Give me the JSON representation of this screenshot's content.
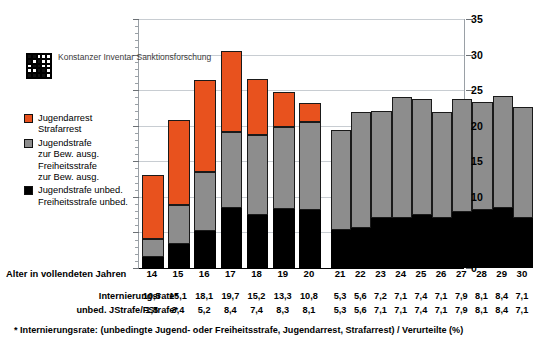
{
  "logo": {
    "name": "konstanzer-inventar-logo",
    "lines": [
      "Konstanzer",
      "Inventar",
      "Sanktionsforschung"
    ]
  },
  "legend": {
    "items": [
      {
        "color": "#e8521e",
        "lines": [
          "Jugendarrest",
          "Strafarrest"
        ]
      },
      {
        "color": "#8d8d8d",
        "lines": [
          "Jugendstrafe",
          "zur Bew. ausg.",
          "Freiheitsstrafe",
          "zur Bew. ausg."
        ]
      },
      {
        "color": "#000000",
        "lines": [
          "Jugendstrafe unbed.",
          "Freiheitsstrafe unbed."
        ]
      }
    ]
  },
  "axis": {
    "x_title": "Alter in vollendeten Jahren",
    "y_ticks": [
      "0",
      "5",
      "10",
      "15",
      "20",
      "25",
      "30",
      "35"
    ]
  },
  "table": {
    "row1_label": "Internierungsrate*",
    "row2_label": "unbed. JStrafe/FStrafe*",
    "row1_left": [
      "10,5",
      "15,1",
      "18,1",
      "19,7",
      "15,2",
      "13,3",
      "10,8"
    ],
    "row1_right": [
      "5,3",
      "5,6",
      "7,2",
      "7,1",
      "7,4",
      "7,1",
      "7,9",
      "8,1",
      "8,4",
      "7,1"
    ],
    "row2_left": [
      "1,5",
      "3,4",
      "5,2",
      "8,4",
      "7,4",
      "8,3",
      "8,1"
    ],
    "row2_right": [
      "5,3",
      "5,6",
      "7,1",
      "7,1",
      "7,4",
      "7,1",
      "7,9",
      "8,1",
      "8,4",
      "7,1"
    ]
  },
  "footnote": "*  Internierungsrate: (unbedingte Jugend- oder Freiheitsstrafe, Jugendarrest, Strafarrest) /  Verurteilte (%)",
  "chart_data": {
    "type": "bar",
    "stacked": true,
    "title": "",
    "xlabel": "Alter in vollendeten Jahren",
    "ylabel": "",
    "ylim": [
      0,
      35
    ],
    "ytick_step": 5,
    "grid": true,
    "legend_position": "left",
    "categories": [
      "14",
      "15",
      "16",
      "17",
      "18",
      "19",
      "20",
      "21",
      "22",
      "23",
      "24",
      "25",
      "26",
      "27",
      "28",
      "29",
      "30"
    ],
    "group_gap_after": "20",
    "series": [
      {
        "name": "Jugendstrafe unbed. Freiheitsstrafe unbed.",
        "color": "#000000",
        "values": [
          1.5,
          3.4,
          5.2,
          8.4,
          7.4,
          8.3,
          8.1,
          5.3,
          5.6,
          7.1,
          7.1,
          7.4,
          7.1,
          7.9,
          8.1,
          8.4,
          7.1
        ]
      },
      {
        "name": "Jugendstrafe zur Bew. ausg. Freiheitsstrafe zur Bew. ausg.",
        "color": "#8d8d8d",
        "values": [
          2.6,
          5.5,
          8.3,
          10.7,
          11.3,
          11.5,
          12.4,
          14.1,
          16.4,
          15.0,
          16.9,
          16.3,
          14.9,
          15.8,
          15.2,
          15.8,
          15.5
        ]
      },
      {
        "name": "Jugendarrest Strafarrest",
        "color": "#e8521e",
        "values": [
          9.0,
          11.9,
          12.9,
          11.4,
          7.9,
          5.0,
          2.7,
          0,
          0,
          0,
          0,
          0,
          0,
          0,
          0,
          0,
          0
        ]
      }
    ],
    "totals": [
      13.1,
      20.8,
      26.4,
      30.5,
      26.6,
      24.8,
      23.2,
      19.4,
      22.0,
      22.1,
      24.0,
      23.7,
      22.0,
      23.7,
      23.3,
      24.2,
      22.6
    ]
  }
}
